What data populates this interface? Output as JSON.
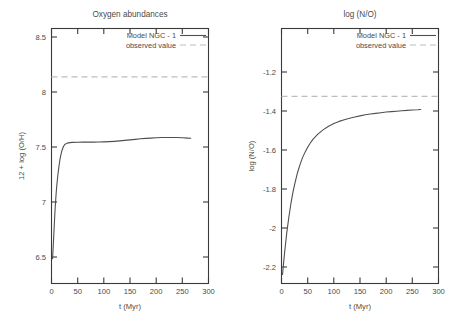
{
  "figure": {
    "background_color": "#ffffff",
    "curve_color": "#4f4f4f",
    "observed_color": "#bdbdbd",
    "axis_color": "#3a3a3a"
  },
  "panels": [
    {
      "id": "oxygen",
      "title": "Oxygen abundances",
      "xlabel": "t (Myr)",
      "ylabel": "12 + log (O/H)",
      "legend": {
        "model_label": "Model NGC - 1",
        "observed_label": "observed value"
      },
      "xticks": [
        "0",
        "50",
        "100",
        "150",
        "200",
        "250",
        "300"
      ],
      "yticks": [
        "6.5",
        "7",
        "7.5",
        "8",
        "8.5"
      ]
    },
    {
      "id": "nitrogen-oxygen",
      "title": "log (N/O)",
      "xlabel": "t (Myr)",
      "ylabel": "log (N/O)",
      "legend": {
        "model_label": "Model NGC - 1",
        "observed_label": "observed value"
      },
      "xticks": [
        "0",
        "50",
        "100",
        "150",
        "200",
        "250",
        "300"
      ],
      "yticks": [
        "-2.2",
        "-2",
        "-1.8",
        "-1.6",
        "-1.4",
        "-1.2"
      ]
    }
  ],
  "chart_data": [
    {
      "type": "line",
      "title": "Oxygen abundances",
      "xlabel": "t (Myr)",
      "ylabel": "12 + log (O/H)",
      "xlim": [
        0,
        300
      ],
      "ylim": [
        6.2,
        8.62
      ],
      "xticks": [
        0,
        50,
        100,
        150,
        200,
        250,
        300
      ],
      "yticks": [
        6.5,
        7,
        7.5,
        8,
        8.5
      ],
      "grid": false,
      "legend_position": "top-right",
      "series": [
        {
          "name": "Model NGC - 1",
          "style": "solid",
          "color": "#4f4f4f",
          "x": [
            2,
            3,
            4,
            5,
            6,
            7,
            8,
            9,
            10,
            12,
            14,
            16,
            18,
            20,
            23,
            26,
            30,
            35,
            40,
            50,
            60,
            70,
            80,
            90,
            100,
            110,
            120,
            130,
            140,
            150,
            160,
            170,
            180,
            190,
            200,
            210,
            220,
            230,
            240,
            250,
            260,
            266
          ],
          "y": [
            6.43,
            6.52,
            6.62,
            6.72,
            6.82,
            6.91,
            6.99,
            7.06,
            7.12,
            7.22,
            7.3,
            7.37,
            7.42,
            7.46,
            7.5,
            7.52,
            7.53,
            7.535,
            7.537,
            7.539,
            7.54,
            7.54,
            7.54,
            7.541,
            7.542,
            7.544,
            7.547,
            7.551,
            7.556,
            7.561,
            7.566,
            7.571,
            7.575,
            7.578,
            7.581,
            7.583,
            7.584,
            7.584,
            7.583,
            7.581,
            7.578,
            7.576
          ]
        },
        {
          "name": "observed value",
          "style": "dashed",
          "color": "#bdbdbd",
          "value": 8.16
        }
      ]
    },
    {
      "type": "line",
      "title": "log (N/O)",
      "xlabel": "t (Myr)",
      "ylabel": "log (N/O)",
      "xlim": [
        0,
        300
      ],
      "ylim": [
        -2.28,
        -1.08
      ],
      "xticks": [
        0,
        50,
        100,
        150,
        200,
        250,
        300
      ],
      "yticks": [
        -2.2,
        -2,
        -1.8,
        -1.6,
        -1.4,
        -1.2
      ],
      "grid": false,
      "legend_position": "top-right",
      "series": [
        {
          "name": "Model NGC - 1",
          "style": "solid",
          "color": "#4f4f4f",
          "x": [
            2,
            4,
            6,
            8,
            10,
            14,
            18,
            22,
            26,
            30,
            35,
            40,
            45,
            50,
            55,
            60,
            70,
            80,
            90,
            100,
            110,
            120,
            130,
            140,
            150,
            160,
            170,
            180,
            190,
            200,
            210,
            220,
            230,
            240,
            250,
            260,
            266
          ],
          "y": [
            -2.24,
            -2.185,
            -2.135,
            -2.09,
            -2.045,
            -1.97,
            -1.905,
            -1.85,
            -1.805,
            -1.765,
            -1.724,
            -1.69,
            -1.663,
            -1.64,
            -1.62,
            -1.603,
            -1.577,
            -1.557,
            -1.541,
            -1.528,
            -1.518,
            -1.51,
            -1.503,
            -1.497,
            -1.492,
            -1.487,
            -1.483,
            -1.48,
            -1.477,
            -1.474,
            -1.472,
            -1.47,
            -1.468,
            -1.466,
            -1.464,
            -1.463,
            -1.462
          ]
        },
        {
          "name": "observed value",
          "style": "dashed",
          "color": "#bdbdbd",
          "value": -1.4
        }
      ]
    }
  ]
}
